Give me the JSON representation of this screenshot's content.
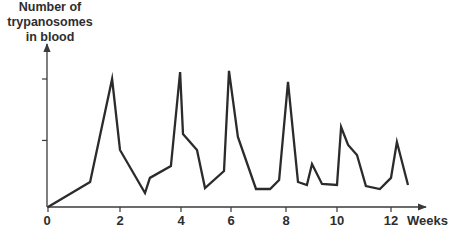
{
  "chart_data": {
    "type": "line",
    "title": "",
    "xlabel": "Weeks",
    "ylabel": "Number of trypanosomes in blood",
    "ylabel_lines": [
      "Number of",
      "trypanosomes",
      "in blood"
    ],
    "x_ticks": [
      0,
      2,
      4,
      6,
      8,
      10,
      12
    ],
    "x_tick_labels": [
      "0",
      "2",
      "4",
      "6",
      "8",
      "10",
      "12"
    ],
    "y_ticks_unlabeled": [
      52,
      100
    ],
    "xlim": [
      0,
      13.1
    ],
    "ylim": [
      0,
      125
    ],
    "grid": false,
    "legend": null,
    "series": [
      {
        "name": "Trypanosomes in blood (relative)",
        "x": [
          0,
          1.17,
          1.78,
          2.0,
          2.82,
          2.98,
          3.67,
          3.97,
          4.08,
          4.64,
          4.96,
          5.72,
          5.92,
          6.25,
          6.91,
          7.42,
          7.75,
          8.08,
          8.47,
          8.82,
          9.02,
          9.41,
          10.0,
          10.15,
          10.41,
          10.74,
          11.07,
          11.59,
          12.0,
          12.22,
          12.63
        ],
        "y": [
          0,
          19.5,
          100,
          44.5,
          10.9,
          22.7,
          32.0,
          105.5,
          57.0,
          44.5,
          14.8,
          28.1,
          106.3,
          54.7,
          14.1,
          14.1,
          21.1,
          97.7,
          19.5,
          17.2,
          33.6,
          18.0,
          17.2,
          62.5,
          48.4,
          40.6,
          16.4,
          14.1,
          22.7,
          50.8,
          17.2
        ]
      }
    ]
  }
}
